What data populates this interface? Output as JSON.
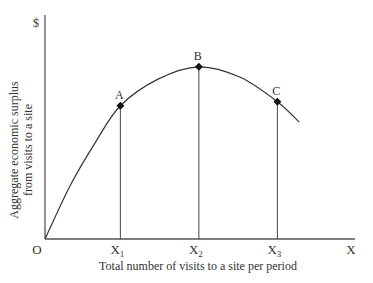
{
  "chart_data": {
    "type": "line",
    "title": "",
    "ylabel_lines": [
      "Aggregate economic surplus",
      "from visits to a site"
    ],
    "xlabel": "Total number of visits to a site per period",
    "y_axis_top_label": "$",
    "origin_label": "O",
    "x_axis_end_label": "X",
    "xlim": [
      0,
      10
    ],
    "ylim": [
      0,
      10
    ],
    "grid": false,
    "legend": "none",
    "x_ticks": [
      {
        "base": "X",
        "sub": "1",
        "x": 2.4
      },
      {
        "base": "X",
        "sub": "2",
        "x": 4.9
      },
      {
        "base": "X",
        "sub": "3",
        "x": 7.4
      }
    ],
    "curve": {
      "name": "aggregate surplus",
      "points": [
        {
          "x": 0,
          "y": 0
        },
        {
          "x": 0.8,
          "y": 2.6
        },
        {
          "x": 1.6,
          "y": 4.7
        },
        {
          "x": 2.4,
          "y": 6.5
        },
        {
          "x": 3.6,
          "y": 7.8
        },
        {
          "x": 4.9,
          "y": 8.4
        },
        {
          "x": 6.2,
          "y": 7.9
        },
        {
          "x": 7.4,
          "y": 6.7
        },
        {
          "x": 8.1,
          "y": 5.7
        }
      ]
    },
    "marked_points": [
      {
        "label": "A",
        "x": 2.4,
        "y": 6.5
      },
      {
        "label": "B",
        "x": 4.9,
        "y": 8.4
      },
      {
        "label": "C",
        "x": 7.4,
        "y": 6.7
      }
    ]
  }
}
